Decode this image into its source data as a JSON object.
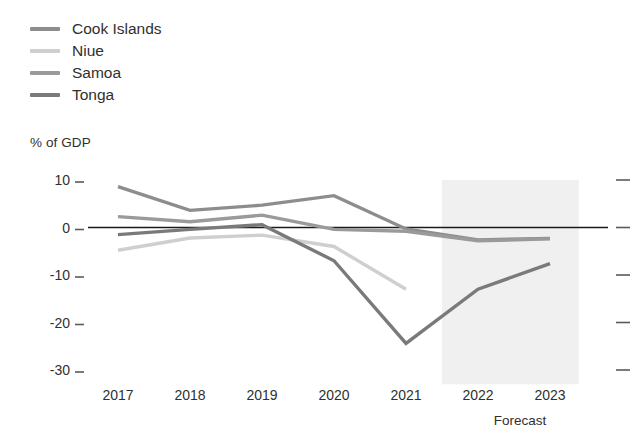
{
  "legend": {
    "items": [
      {
        "label": "Cook Islands",
        "color": "#8d8d8d"
      },
      {
        "label": "Niue",
        "color": "#cfcfcf"
      },
      {
        "label": "Samoa",
        "color": "#9a9a9a"
      },
      {
        "label": "Tonga",
        "color": "#7a7a7a"
      }
    ]
  },
  "axis": {
    "y_title": "% of GDP",
    "y_ticks": [
      "10",
      "0",
      "-10",
      "-20",
      "-30"
    ],
    "x_ticks": [
      "2017",
      "2018",
      "2019",
      "2020",
      "2021",
      "2022",
      "2023"
    ],
    "forecast_label": "Forecast"
  },
  "chart_data": {
    "type": "line",
    "title": "",
    "subtitle": "",
    "xlabel": "",
    "ylabel": "% of GDP",
    "categories": [
      2017,
      2018,
      2019,
      2020,
      2021,
      2022,
      2023
    ],
    "x": [
      2017,
      2018,
      2019,
      2020,
      2021,
      2022,
      2023
    ],
    "ylim": [
      -33,
      12
    ],
    "xlim": [
      2016.6,
      2023.4
    ],
    "yticks": [
      10,
      0,
      -10,
      -20,
      -30
    ],
    "grid": false,
    "legend_position": "top-left",
    "zero_line": 0,
    "annotations": [
      {
        "text": "Forecast",
        "x_start": 2021.5,
        "x_end": 2023.4,
        "type": "shaded-band"
      }
    ],
    "series": [
      {
        "name": "Cook Islands",
        "color": "#8d8d8d",
        "x": [
          2017,
          2018,
          2019,
          2020,
          2021,
          2022,
          2023
        ],
        "values": [
          8.6,
          3.6,
          4.7,
          6.7,
          -0.3,
          -2.6,
          -2.3
        ]
      },
      {
        "name": "Niue",
        "color": "#cfcfcf",
        "x": [
          2017,
          2018,
          2019,
          2020,
          2021
        ],
        "values": [
          -4.8,
          -2.2,
          -1.6,
          -4.0,
          -13.0
        ]
      },
      {
        "name": "Samoa",
        "color": "#9a9a9a",
        "x": [
          2017,
          2018,
          2019,
          2020,
          2021,
          2022,
          2023
        ],
        "values": [
          2.3,
          1.2,
          2.6,
          -0.4,
          -0.8,
          -2.8,
          -2.4
        ]
      },
      {
        "name": "Tonga",
        "color": "#7a7a7a",
        "x": [
          2017,
          2018,
          2019,
          2020,
          2021,
          2022,
          2023
        ],
        "values": [
          -1.5,
          -0.4,
          0.6,
          -7.0,
          -24.4,
          -13.0,
          -7.6
        ]
      }
    ]
  }
}
